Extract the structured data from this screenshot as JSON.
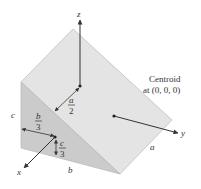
{
  "diagram": {
    "title_label": "Centroid",
    "subtitle_label": "at (0, 0, 0)",
    "axes": {
      "x": "x",
      "y": "y",
      "z": "z"
    },
    "dimensions": {
      "a": "a",
      "b": "b",
      "c": "c"
    },
    "fractions": {
      "a_half": {
        "num": "a",
        "den": "2"
      },
      "b_third": {
        "num": "b",
        "den": "3"
      },
      "c_third": {
        "num": "c",
        "den": "3"
      }
    },
    "colors": {
      "slope_face": "#e2e2e2",
      "side_face": "#c9c9c9",
      "edge": "#9a9a9a",
      "arrow": "#333333"
    }
  }
}
